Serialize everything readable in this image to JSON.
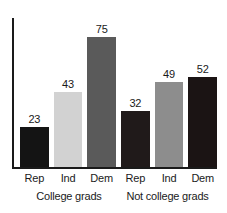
{
  "chart_data": {
    "type": "bar",
    "title": "",
    "subtitle": "",
    "xlabel": "",
    "ylabel": "",
    "ylim": [
      0,
      80
    ],
    "grid": false,
    "legend": "none",
    "axis": {
      "y_axis_visible": true,
      "y_ticks_visible": false,
      "y_ticklabels": [],
      "x_axis_visible": true
    },
    "categories": [
      "Rep",
      "Ind",
      "Dem",
      "Rep",
      "Ind",
      "Dem"
    ],
    "values": [
      23,
      43,
      75,
      32,
      49,
      52
    ],
    "value_labels": [
      "23",
      "43",
      "75",
      "32",
      "49",
      "52"
    ],
    "bar_colors": [
      "#141414",
      "#d2d2d2",
      "#5a5a5a",
      "#201a1a",
      "#8d8d8d",
      "#1b1414"
    ],
    "groups": [
      {
        "label": "College grads",
        "categories": [
          "Rep",
          "Ind",
          "Dem"
        ],
        "values": [
          23,
          43,
          75
        ]
      },
      {
        "label": "Not college grads",
        "categories": [
          "Rep",
          "Ind",
          "Dem"
        ],
        "values": [
          32,
          49,
          52
        ]
      }
    ]
  },
  "colors": {
    "axis": "#1a1a1a",
    "text": "#1a1a1a",
    "background": "#ffffff"
  }
}
